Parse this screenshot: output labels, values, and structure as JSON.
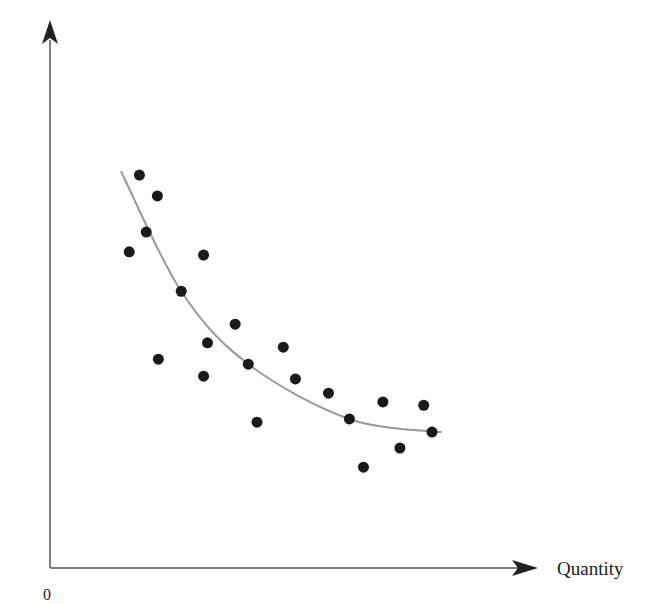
{
  "chart_data": {
    "type": "scatter",
    "title": "",
    "xlabel": "Quantity",
    "ylabel": "",
    "origin_label": "0",
    "grid": false,
    "legend": null,
    "xlim": [
      0,
      100
    ],
    "ylim": [
      0,
      100
    ],
    "series": [
      {
        "name": "observations",
        "kind": "scatter",
        "color": "#1a1a1a",
        "points": [
          {
            "x": 18.4,
            "y": 71.7
          },
          {
            "x": 22.1,
            "y": 67.9
          },
          {
            "x": 19.8,
            "y": 61.3
          },
          {
            "x": 16.3,
            "y": 57.7
          },
          {
            "x": 31.6,
            "y": 57.1
          },
          {
            "x": 27.0,
            "y": 50.5
          },
          {
            "x": 38.1,
            "y": 44.5
          },
          {
            "x": 32.4,
            "y": 41.1
          },
          {
            "x": 22.3,
            "y": 38.1
          },
          {
            "x": 40.8,
            "y": 37.2
          },
          {
            "x": 31.6,
            "y": 35.0
          },
          {
            "x": 48.0,
            "y": 40.3
          },
          {
            "x": 50.5,
            "y": 34.5
          },
          {
            "x": 57.3,
            "y": 31.9
          },
          {
            "x": 42.6,
            "y": 26.6
          },
          {
            "x": 61.6,
            "y": 27.2
          },
          {
            "x": 68.5,
            "y": 30.3
          },
          {
            "x": 76.9,
            "y": 29.7
          },
          {
            "x": 72.0,
            "y": 21.9
          },
          {
            "x": 64.5,
            "y": 18.4
          },
          {
            "x": 78.6,
            "y": 24.8
          }
        ]
      },
      {
        "name": "fitted curve",
        "kind": "line",
        "color": "#999999",
        "points": [
          {
            "x": 14.6,
            "y": 72.4
          },
          {
            "x": 27.0,
            "y": 50.5
          },
          {
            "x": 40.8,
            "y": 37.2
          },
          {
            "x": 61.6,
            "y": 27.2
          },
          {
            "x": 80.6,
            "y": 24.8
          }
        ]
      }
    ]
  }
}
